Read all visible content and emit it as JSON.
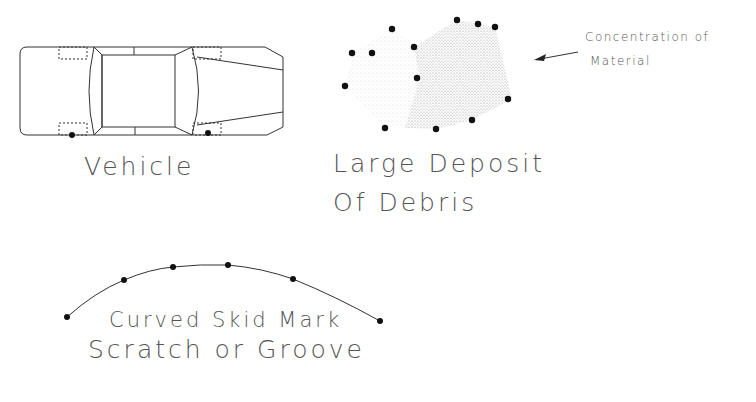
{
  "symbols": {
    "vehicle": {
      "label": "Vehicle"
    },
    "debris": {
      "label_line1": "Large Deposit",
      "label_line2": "Of Debris"
    },
    "annotation": {
      "line1": "Concentration of",
      "line2": "Material"
    },
    "skid": {
      "label_line1": "Curved Skid Mark",
      "label_line2": "Scratch or Groove"
    }
  },
  "colors": {
    "line": "#333333",
    "dot": "#111111",
    "text": "#555555",
    "stipple": "#888888"
  }
}
